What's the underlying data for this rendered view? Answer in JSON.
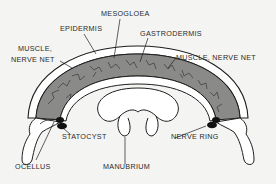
{
  "diagram": {
    "labels": {
      "mesogloea": "MESOGLOEA",
      "epidermis": "EPIDERMIS",
      "gastrodermis": "GASTRODERMIS",
      "muscle_nerve_net_left_1": "MUSCLE,",
      "muscle_nerve_net_left_2": "NERVE NET",
      "muscle_nerve_net_right": "MUSCLE, NERVE NET",
      "statocyst": "STATOCYST",
      "nerve_ring": "NERVE RING",
      "ocellus": "OCELLUS",
      "manubrium": "MANUBRIUM"
    },
    "colors": {
      "background": "#f4f4f2",
      "outline": "#1e1e1e",
      "mesogloea_fill": "#8a8a88",
      "tissue_fill": "#ffffff",
      "label_text": "#2a2a2a"
    }
  }
}
